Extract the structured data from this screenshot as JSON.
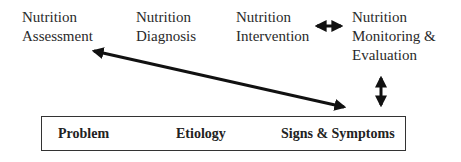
{
  "stages": [
    {
      "line1": "Nutrition",
      "line2": "Assessment"
    },
    {
      "line1": "Nutrition",
      "line2": "Diagnosis"
    },
    {
      "line1": "Nutrition",
      "line2": "Intervention"
    },
    {
      "line1": "Nutrition",
      "line2": "Monitoring &",
      "line3": "Evaluation"
    }
  ],
  "pes_statement": {
    "items": [
      "Problem",
      "Etiology",
      "Signs & Symptoms"
    ]
  },
  "arrows": [
    {
      "from": "Nutrition Intervention",
      "to": "Nutrition Monitoring & Evaluation",
      "type": "bidirectional"
    },
    {
      "from": "Signs & Symptoms",
      "to": "Nutrition Assessment",
      "type": "bidirectional"
    },
    {
      "from": "Nutrition Monitoring & Evaluation",
      "to": "Signs & Symptoms",
      "type": "bidirectional"
    }
  ]
}
